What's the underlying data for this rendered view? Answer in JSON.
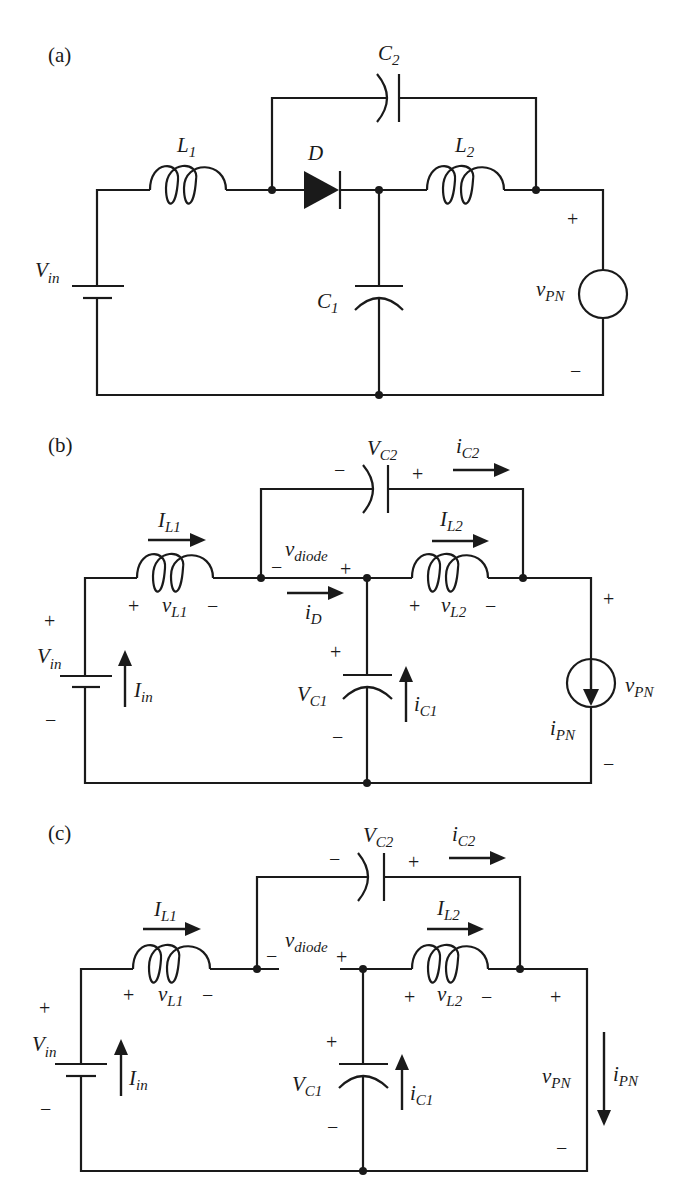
{
  "figure": {
    "panels": [
      {
        "id": "a",
        "label": "(a)",
        "title": "Circuit schematic",
        "components": {
          "source": {
            "name": "V",
            "sub": "in"
          },
          "L1": {
            "name": "L",
            "sub": "1"
          },
          "L2": {
            "name": "L",
            "sub": "2"
          },
          "C1": {
            "name": "C",
            "sub": "1"
          },
          "C2": {
            "name": "C",
            "sub": "2"
          },
          "diode": {
            "name": "D"
          },
          "load": {
            "name": "v",
            "sub": "PN",
            "plus": "+",
            "minus": "−"
          }
        }
      },
      {
        "id": "b",
        "label": "(b)",
        "title": "Diode conducting equivalent",
        "labels": {
          "IL1": {
            "name": "I",
            "sub": "L1"
          },
          "vL1": {
            "name": "v",
            "sub": "L1",
            "plus": "+",
            "minus": "−"
          },
          "IL2": {
            "name": "I",
            "sub": "L2"
          },
          "vL2": {
            "name": "v",
            "sub": "L2",
            "plus": "+",
            "minus": "−"
          },
          "VC2": {
            "name": "V",
            "sub": "C2",
            "plus": "+",
            "minus": "−"
          },
          "iC2": {
            "name": "i",
            "sub": "C2"
          },
          "vdiode": {
            "name": "v",
            "sub": "diode",
            "plus": "+",
            "minus": "−"
          },
          "iD": {
            "name": "i",
            "sub": "D"
          },
          "Vin": {
            "name": "V",
            "sub": "in",
            "plus": "+",
            "minus": "−"
          },
          "Iin": {
            "name": "I",
            "sub": "in"
          },
          "VC1": {
            "name": "V",
            "sub": "C1",
            "plus": "+",
            "minus": "−"
          },
          "iC1": {
            "name": "i",
            "sub": "C1"
          },
          "vPN": {
            "name": "v",
            "sub": "PN",
            "plus": "+",
            "minus": "−"
          },
          "iPN": {
            "name": "i",
            "sub": "PN"
          }
        }
      },
      {
        "id": "c",
        "label": "(c)",
        "title": "Diode open equivalent",
        "labels": {
          "IL1": {
            "name": "I",
            "sub": "L1"
          },
          "vL1": {
            "name": "v",
            "sub": "L1",
            "plus": "+",
            "minus": "−"
          },
          "IL2": {
            "name": "I",
            "sub": "L2"
          },
          "vL2": {
            "name": "v",
            "sub": "L2",
            "plus": "+",
            "minus": "−"
          },
          "VC2": {
            "name": "V",
            "sub": "C2",
            "plus": "+",
            "minus": "−"
          },
          "iC2": {
            "name": "i",
            "sub": "C2"
          },
          "vdiode": {
            "name": "v",
            "sub": "diode",
            "plus": "+",
            "minus": "−"
          },
          "Vin": {
            "name": "V",
            "sub": "in",
            "plus": "+",
            "minus": "−"
          },
          "Iin": {
            "name": "I",
            "sub": "in"
          },
          "VC1": {
            "name": "V",
            "sub": "C1",
            "plus": "+",
            "minus": "−"
          },
          "iC1": {
            "name": "i",
            "sub": "C1"
          },
          "vPN": {
            "name": "v",
            "sub": "PN",
            "plus": "+",
            "minus": "−"
          },
          "iPN": {
            "name": "i",
            "sub": "PN"
          }
        }
      }
    ]
  }
}
